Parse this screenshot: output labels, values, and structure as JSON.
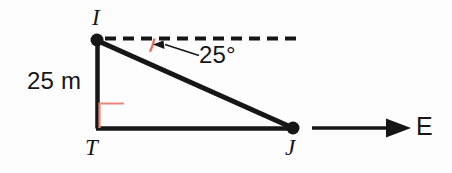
{
  "diagram": {
    "type": "right-triangle-angle-of-depression",
    "background_color": "#fdfdfd",
    "stroke_color": "#161616",
    "accent_color": "#e8705a",
    "points": {
      "I": {
        "label": "I",
        "x": 97,
        "y": 40
      },
      "T": {
        "label": "T",
        "x": 97,
        "y": 128
      },
      "J": {
        "label": "J",
        "x": 293,
        "y": 128
      }
    },
    "labels": {
      "vertex_top": "I",
      "vertex_bottom_left": "T",
      "vertex_bottom_right": "J",
      "side_vertical": "25 m",
      "angle": "25°",
      "direction": "E"
    },
    "measurements": {
      "height_value": 25,
      "height_unit": "m",
      "angle_value": 25,
      "angle_unit": "°"
    },
    "markers": {
      "right_angle_at": "T",
      "angle_arc_at": "I",
      "horizontal_reference": "dashed",
      "direction_arrow": "east"
    }
  }
}
